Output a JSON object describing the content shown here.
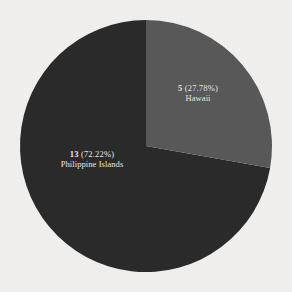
{
  "background_color": "#f3f1ef",
  "chart_data": {
    "type": "pie",
    "title": "",
    "subtitle": "",
    "xlabel": "",
    "ylabel": "",
    "legend_position": "none",
    "grid": false,
    "total": 18,
    "start_angle_deg": 0,
    "direction": "clockwise",
    "center": {
      "x": 146,
      "y": 146
    },
    "radius": 126,
    "categories": [
      "Hawaii",
      "Philippine Islands"
    ],
    "values": [
      5,
      13
    ],
    "percentages": [
      27.78,
      72.22
    ],
    "colors": [
      "#595959",
      "#2b2b2b"
    ],
    "slices": [
      {
        "name": "Hawaii",
        "value": 5,
        "percent": 27.78,
        "color": "#595959",
        "value_label": "5",
        "percent_label": "(27.78%)",
        "category_label": "Hawaii",
        "label_color": "#e9e7e4"
      },
      {
        "name": "Philippine Islands",
        "value": 13,
        "percent": 72.22,
        "color": "#2b2b2b",
        "value_label": "13",
        "percent_label": "(72.22%)",
        "category_label": "Philippine Islands",
        "label_color": "#ebe9e6"
      }
    ]
  }
}
